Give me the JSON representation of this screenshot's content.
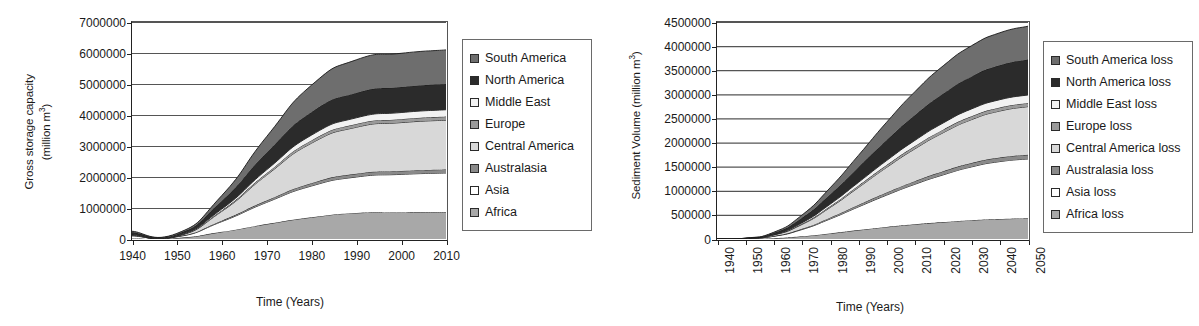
{
  "figure": {
    "panel_count": 2
  },
  "palette": {
    "south_america": "#6e6e6e",
    "north_america": "#2b2b2b",
    "middle_east": "#f2f2f2",
    "europe": "#9a9a9a",
    "central_america": "#d8d8d8",
    "australasia": "#8a8a8a",
    "asia": "#ffffff",
    "africa": "#a8a8a8",
    "axis": "#222222",
    "gridline": "#555555",
    "legend_border": "#6a6a6a",
    "text": "#1a1a1a"
  },
  "chart_data": [
    {
      "id": "gross-storage-capacity",
      "type": "area",
      "stacked": true,
      "title": "",
      "xlabel": "Time (Years)",
      "ylabel": "Gross storage capacity\n(million m3)",
      "ylabel_line1": "Gross storage capacity",
      "ylabel_line2_prefix": "(million m",
      "ylabel_line2_sup": "3",
      "ylabel_line2_suffix": ")",
      "x": [
        1940,
        1950,
        1960,
        1970,
        1980,
        1990,
        2000,
        2010
      ],
      "categories": [
        "1940",
        "1950",
        "1960",
        "1970",
        "1980",
        "1990",
        "2000",
        "2010"
      ],
      "xlim": [
        1940,
        2010
      ],
      "ylim": [
        0,
        7000000
      ],
      "yticks": [
        0,
        1000000,
        2000000,
        3000000,
        4000000,
        5000000,
        6000000,
        7000000
      ],
      "ytick_labels": [
        "0",
        "1000000",
        "2000000",
        "3000000",
        "4000000",
        "5000000",
        "6000000",
        "7000000"
      ],
      "xtick_labels_rotated": false,
      "grid": "horizontal",
      "legend_position": "right",
      "series": [
        {
          "name": "Africa",
          "color": "#a8a8a8",
          "values": [
            20000,
            30000,
            230000,
            480000,
            700000,
            840000,
            855000,
            860000
          ]
        },
        {
          "name": "Asia",
          "color": "#ffffff",
          "values": [
            80000,
            40000,
            330000,
            700000,
            1010000,
            1160000,
            1230000,
            1270000
          ]
        },
        {
          "name": "Australasia",
          "color": "#8a8a8a",
          "values": [
            15000,
            10000,
            30000,
            60000,
            90000,
            105000,
            110000,
            115000
          ]
        },
        {
          "name": "Central America",
          "color": "#d8d8d8",
          "values": [
            10000,
            8000,
            300000,
            820000,
            1290000,
            1500000,
            1560000,
            1590000
          ]
        },
        {
          "name": "Europe",
          "color": "#9a9a9a",
          "values": [
            12000,
            8000,
            30000,
            60000,
            90000,
            105000,
            110000,
            115000
          ]
        },
        {
          "name": "Middle East",
          "color": "#f2f2f2",
          "values": [
            8000,
            5000,
            45000,
            110000,
            170000,
            200000,
            215000,
            220000
          ]
        },
        {
          "name": "North America",
          "color": "#2b2b2b",
          "values": [
            70000,
            55000,
            260000,
            550000,
            740000,
            800000,
            820000,
            830000
          ]
        },
        {
          "name": "South America",
          "color": "#6e6e6e",
          "values": [
            35000,
            24000,
            175000,
            520000,
            870000,
            1070000,
            1090000,
            1100000
          ]
        }
      ],
      "totals": [
        250000,
        180000,
        1400000,
        3300000,
        4960000,
        5780000,
        5990000,
        6100000
      ],
      "legend": [
        {
          "label": "South America",
          "color": "#6e6e6e"
        },
        {
          "label": "North America",
          "color": "#2b2b2b"
        },
        {
          "label": "Middle East",
          "color": "#f2f2f2"
        },
        {
          "label": "Europe",
          "color": "#9a9a9a"
        },
        {
          "label": "Central America",
          "color": "#d8d8d8"
        },
        {
          "label": "Australasia",
          "color": "#8a8a8a"
        },
        {
          "label": "Asia",
          "color": "#ffffff"
        },
        {
          "label": "Africa",
          "color": "#a8a8a8"
        }
      ]
    },
    {
      "id": "sediment-volume-loss",
      "type": "area",
      "stacked": true,
      "title": "",
      "xlabel": "Time (Years)",
      "ylabel": "Sediment Volume (million m3)",
      "ylabel_line1_prefix": "Sediment Volume (million m",
      "ylabel_line1_sup": "3",
      "ylabel_line1_suffix": ")",
      "x": [
        1940,
        1950,
        1960,
        1970,
        1980,
        1990,
        2000,
        2010,
        2020,
        2030,
        2040,
        2050
      ],
      "categories": [
        "1940",
        "1950",
        "1960",
        "1970",
        "1980",
        "1990",
        "2000",
        "2010",
        "2020",
        "2030",
        "2040",
        "2050"
      ],
      "xlim": [
        1940,
        2050
      ],
      "ylim": [
        0,
        4500000
      ],
      "yticks": [
        0,
        500000,
        1000000,
        1500000,
        2000000,
        2500000,
        3000000,
        3500000,
        4000000,
        4500000
      ],
      "ytick_labels": [
        "0",
        "500000",
        "1000000",
        "1500000",
        "2000000",
        "2500000",
        "3000000",
        "3500000",
        "4000000",
        "4500000"
      ],
      "xtick_labels_rotated": true,
      "grid": "horizontal",
      "legend_position": "right",
      "series": [
        {
          "name": "Africa loss",
          "color": "#a8a8a8",
          "values": [
            0,
            2000,
            15000,
            55000,
            115000,
            185000,
            250000,
            305000,
            350000,
            390000,
            415000,
            430000
          ]
        },
        {
          "name": "Asia loss",
          "color": "#ffffff",
          "values": [
            0,
            5000,
            40000,
            140000,
            300000,
            480000,
            660000,
            830000,
            980000,
            1105000,
            1190000,
            1230000
          ]
        },
        {
          "name": "Australasia loss",
          "color": "#8a8a8a",
          "values": [
            0,
            1000,
            5000,
            15000,
            28000,
            42000,
            55000,
            65000,
            74000,
            80000,
            84000,
            86000
          ]
        },
        {
          "name": "Central America loss",
          "color": "#d8d8d8",
          "values": [
            0,
            2000,
            22000,
            90000,
            210000,
            360000,
            520000,
            670000,
            800000,
            900000,
            965000,
            1000000
          ]
        },
        {
          "name": "Europe loss",
          "color": "#9a9a9a",
          "values": [
            0,
            1000,
            5000,
            14000,
            26000,
            38000,
            48000,
            57000,
            64000,
            69000,
            72000,
            74000
          ]
        },
        {
          "name": "Middle East loss",
          "color": "#f2f2f2",
          "values": [
            0,
            1000,
            6000,
            20000,
            42000,
            68000,
            94000,
            118000,
            138000,
            153000,
            163000,
            168000
          ]
        },
        {
          "name": "North America loss",
          "color": "#2b2b2b",
          "values": [
            0,
            4000,
            30000,
            100000,
            200000,
            310000,
            420000,
            520000,
            605000,
            670000,
            712000,
            735000
          ]
        },
        {
          "name": "South America loss",
          "color": "#6e6e6e",
          "values": [
            0,
            2000,
            15000,
            60000,
            140000,
            250000,
            375000,
            490000,
            580000,
            640000,
            675000,
            690000
          ]
        }
      ],
      "totals": [
        0,
        18000,
        138000,
        494000,
        1061000,
        1733000,
        2422000,
        3055000,
        3591000,
        4007000,
        4276000,
        4413000
      ],
      "legend": [
        {
          "label": "South America loss",
          "color": "#6e6e6e"
        },
        {
          "label": "North America loss",
          "color": "#2b2b2b"
        },
        {
          "label": "Middle East loss",
          "color": "#f2f2f2"
        },
        {
          "label": "Europe loss",
          "color": "#9a9a9a"
        },
        {
          "label": "Central America loss",
          "color": "#d8d8d8"
        },
        {
          "label": "Australasia loss",
          "color": "#8a8a8a"
        },
        {
          "label": "Asia loss",
          "color": "#ffffff"
        },
        {
          "label": "Africa loss",
          "color": "#a8a8a8"
        }
      ]
    }
  ]
}
